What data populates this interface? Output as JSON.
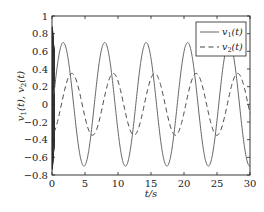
{
  "chart_data": {
    "type": "line",
    "title": "",
    "xlabel": "t/s",
    "ylabel": "v1(t), v2(t)",
    "xlim": [
      0,
      30
    ],
    "ylim": [
      -0.8,
      1.0
    ],
    "xticks": [
      0,
      5,
      10,
      15,
      20,
      25,
      30
    ],
    "xtick_labels": [
      "0",
      "5",
      "10",
      "15",
      "20",
      "25",
      "30"
    ],
    "yticks": [
      -0.8,
      -0.6,
      -0.4,
      -0.2,
      0,
      0.2,
      0.4,
      0.6,
      0.8,
      1.0
    ],
    "ytick_labels": [
      "−0.8",
      "−0.6",
      "−0.4",
      "−0.2",
      "0",
      "0.2",
      "0.4",
      "0.6",
      "0.8",
      "1"
    ],
    "grid": false,
    "legend_position": "upper right",
    "series": [
      {
        "name": "v1(t)",
        "style": "solid",
        "color": "#555555",
        "model": {
          "amplitude": 0.7,
          "omega": 1.0,
          "phase": 0.13
        },
        "peaks_t": [
          1.7,
          8.0,
          14.2,
          20.4,
          26.7
        ],
        "troughs_t": [
          4.8,
          11.1,
          17.3,
          23.5,
          29.8
        ],
        "peak_value": 0.7,
        "trough_value": -0.7
      },
      {
        "name": "v2(t)",
        "style": "dashed",
        "color": "#444444",
        "model": {
          "amplitude": 0.35,
          "omega": 1.0,
          "phase": 1.43
        },
        "peaks_t": [
          3.0,
          9.2,
          15.5,
          21.8,
          28.0
        ],
        "troughs_t": [
          6.1,
          12.3,
          18.5,
          24.8
        ],
        "peak_value": 0.34,
        "trough_value": -0.35
      }
    ],
    "annotations": [
      "dense transient oscillation near t=0 spanning approx -0.8 to 0.95"
    ]
  },
  "legend": {
    "v1_label_main": "v",
    "v1_label_sub": "1",
    "v1_label_rest": "(t)",
    "v2_label_main": "v",
    "v2_label_sub": "2",
    "v2_label_rest": "(t)"
  },
  "axes": {
    "xlabel": "t/s",
    "ylabel_part1": "v",
    "ylabel_sub1": "1",
    "ylabel_part2": "(t), v",
    "ylabel_sub2": "2",
    "ylabel_part3": "(t)"
  }
}
